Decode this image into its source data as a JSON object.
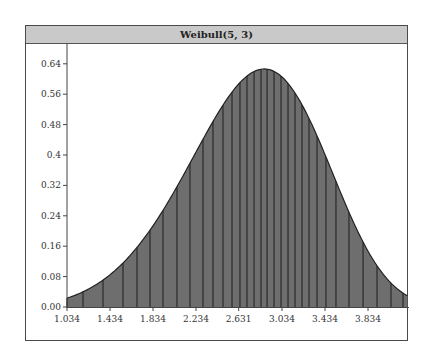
{
  "chart_data": {
    "type": "area",
    "title": "Weibull(5, 3)",
    "distribution": {
      "name": "Weibull",
      "shape": 5,
      "scale": 3
    },
    "xlabel": "",
    "ylabel": "",
    "xlim": [
      1.034,
      4.2
    ],
    "ylim": [
      0,
      0.66
    ],
    "x_ticks": [
      1.034,
      1.434,
      1.834,
      2.234,
      2.631,
      3.034,
      3.434,
      3.834
    ],
    "x_tick_labels": [
      "1.034",
      "1.434",
      "1.834",
      "2.234",
      "2.631",
      "3.034",
      "3.434",
      "3.834"
    ],
    "y_ticks": [
      0.0,
      0.08,
      0.16,
      0.24,
      0.32,
      0.4,
      0.48,
      0.56,
      0.64
    ],
    "y_tick_labels": [
      "0.00",
      "0.08",
      "0.16",
      "0.24",
      "0.32",
      "0.4",
      "0.48",
      "0.56",
      "0.64"
    ],
    "peak": {
      "x": 2.869,
      "y": 0.627
    },
    "series": [
      {
        "name": "Weibull(5, 3) density",
        "x": [
          1.034,
          1.2,
          1.4,
          1.6,
          1.8,
          2.0,
          2.2,
          2.4,
          2.6,
          2.8,
          2.869,
          3.0,
          3.2,
          3.4,
          3.6,
          3.8,
          4.0,
          4.2
        ],
        "values": [
          0.023,
          0.043,
          0.08,
          0.134,
          0.206,
          0.293,
          0.389,
          0.48,
          0.56,
          0.615,
          0.627,
          0.605,
          0.534,
          0.416,
          0.278,
          0.155,
          0.07,
          0.03
        ]
      }
    ],
    "vertical_lines_x": [
      1.183,
      1.369,
      1.555,
      1.685,
      1.806,
      1.927,
      2.057,
      2.178,
      2.299,
      2.392,
      2.485,
      2.569,
      2.643,
      2.708,
      2.774,
      2.839,
      2.895,
      2.96,
      3.025,
      3.09,
      3.155,
      3.22,
      3.285,
      3.36,
      3.443,
      3.536,
      3.657,
      3.788,
      3.918,
      4.048,
      4.16
    ],
    "fill_color": "#6e6e6e",
    "line_color": "#2a2a2a",
    "title_bar_color": "#c9c9c9",
    "grid": false,
    "legend": null
  }
}
